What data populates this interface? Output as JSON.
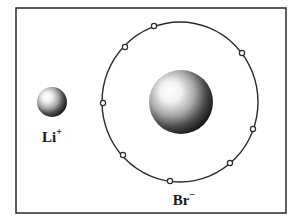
{
  "diagram": {
    "type": "ionic-bond-illustration",
    "frame": {
      "x": 16,
      "y": 8,
      "width": 270,
      "height": 205,
      "stroke": "#2a2a2a"
    },
    "cation": {
      "symbol": "Li",
      "charge": "+",
      "center": [
        52,
        102
      ],
      "radius": 15
    },
    "anion": {
      "symbol": "Br",
      "charge": "−",
      "nucleus_center": [
        181,
        102
      ],
      "nucleus_radius": 32,
      "shell": {
        "cx": 180,
        "cy": 102,
        "rx": 78,
        "ry": 80
      },
      "electron_count": 8,
      "electrons": [
        [
          154,
          26
        ],
        [
          125,
          47
        ],
        [
          242,
          53
        ],
        [
          103,
          103
        ],
        [
          253,
          129
        ],
        [
          123,
          155
        ],
        [
          230,
          163
        ],
        [
          170,
          181
        ]
      ]
    },
    "colors": {
      "line": "#2a2a2a",
      "sphere_highlight": "#ffffff",
      "sphere_shadow": "#1a1a1a",
      "background": "#ffffff"
    }
  }
}
